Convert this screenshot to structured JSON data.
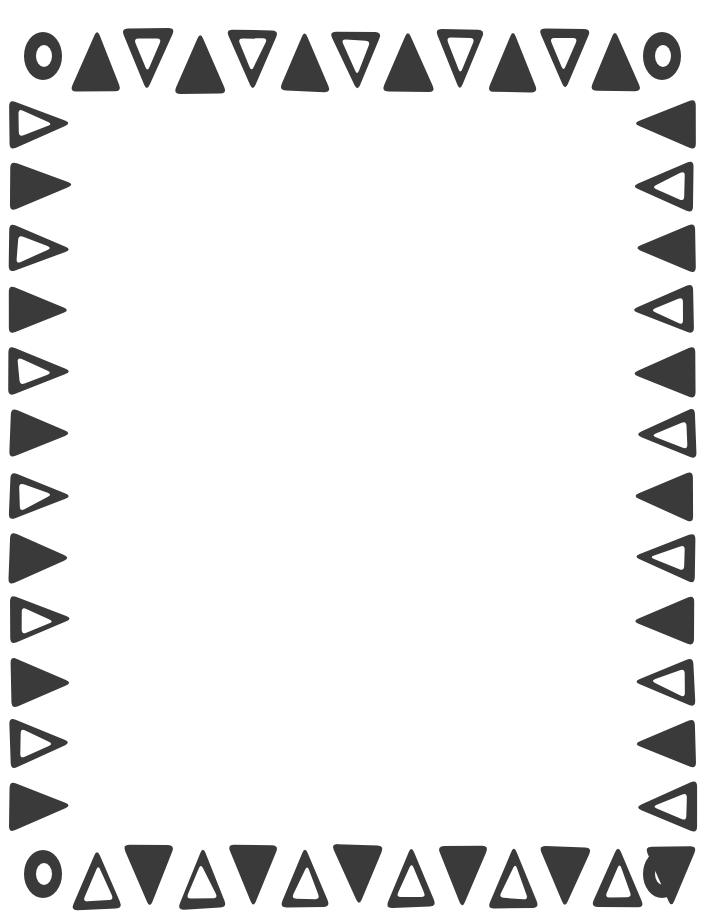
{
  "document": {
    "title": "Decorative Triangle Border Frame",
    "kind": "page-border-clipart",
    "width": 705,
    "height": 922,
    "background_color": "#ffffff",
    "ink_color": "#3a3a3a",
    "style": "hand-drawn, slightly irregular edges, rounded corners",
    "inner_field_label": "blank content area"
  },
  "geometry": {
    "outer_margin_left": 8,
    "outer_margin_top": 20,
    "inner_field": {
      "x": 82,
      "y": 96,
      "width": 540,
      "height": 730
    },
    "triangle_width": 52,
    "triangle_height": 62,
    "side_triangle_width": 62,
    "side_triangle_height": 52,
    "top_row_y": 30,
    "bottom_row_y": 846,
    "left_col_x": 10,
    "right_col_x": 633
  },
  "corners": {
    "shape": "ring",
    "outer_rx": 19,
    "outer_ry": 24,
    "inner_rx": 8,
    "inner_ry": 11,
    "items": [
      {
        "name": "corner-ring-top-left",
        "cx": 43,
        "cy": 56
      },
      {
        "name": "corner-ring-top-right",
        "cx": 662,
        "cy": 56
      },
      {
        "name": "corner-ring-bottom-left",
        "cx": 43,
        "cy": 874
      },
      {
        "name": "corner-ring-bottom-right",
        "cx": 662,
        "cy": 874
      }
    ]
  },
  "borders": {
    "top": {
      "name": "top-border-row",
      "description": "alternating filled up-triangles and outlined down-triangles",
      "start_x": 70,
      "step": 52,
      "count": 11,
      "first_style": "filled",
      "filled_direction": "up",
      "outlined_direction": "down"
    },
    "bottom": {
      "name": "bottom-border-row",
      "description": "alternating outlined up-triangles and filled down-triangles",
      "start_x": 72,
      "step": 52,
      "count": 12,
      "first_style": "outlined",
      "filled_direction": "down",
      "outlined_direction": "up"
    },
    "left": {
      "name": "left-border-column",
      "description": "right-pointing triangles alternating outlined and filled",
      "start_y": 98,
      "step": 62,
      "count": 12,
      "first_style": "outlined",
      "direction": "right"
    },
    "right": {
      "name": "right-border-column",
      "description": "left-pointing triangles alternating filled and outlined",
      "start_y": 98,
      "step": 62,
      "count": 12,
      "first_style": "filled",
      "direction": "left"
    }
  }
}
